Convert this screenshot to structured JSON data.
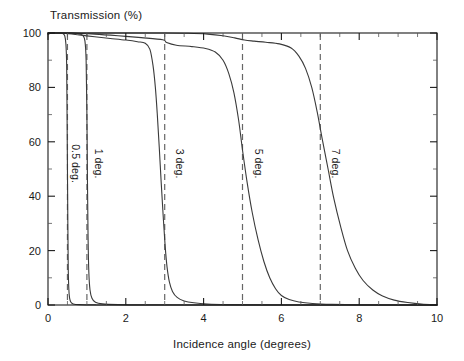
{
  "chart_data": {
    "type": "line",
    "title": "",
    "ylabel": "Transmission (%)",
    "xlabel": "Incidence angle (degrees)",
    "xlim": [
      0,
      10
    ],
    "ylim": [
      0,
      100
    ],
    "grid": false,
    "legend": "inline-rotated-labels",
    "xticks": [
      0,
      2,
      4,
      6,
      8,
      10
    ],
    "xticklabels": [
      "0",
      "2",
      "4",
      "6",
      "8",
      "10"
    ],
    "xminorticks": [
      0.5,
      1,
      1.5,
      2.5,
      3,
      3.5,
      4.5,
      5,
      5.5,
      6.5,
      7,
      7.5,
      8.5,
      9,
      9.5
    ],
    "yticks": [
      0,
      20,
      40,
      60,
      80,
      100
    ],
    "yticklabels": [
      "0",
      "20",
      "40",
      "60",
      "80",
      "100"
    ],
    "yminorticks": [
      10,
      30,
      50,
      70,
      90
    ],
    "reference_lines": [
      {
        "x": 0.5,
        "style": "dashed"
      },
      {
        "x": 1.0,
        "style": "dashed"
      },
      {
        "x": 3.0,
        "style": "dashed"
      },
      {
        "x": 5.0,
        "style": "dashed"
      },
      {
        "x": 7.0,
        "style": "dashed"
      }
    ],
    "annotations": [
      {
        "text": "0.5 deg.",
        "x": 0.62,
        "y": 52,
        "rotation": 90
      },
      {
        "text": "1 deg.",
        "x": 1.22,
        "y": 52,
        "rotation": 90
      },
      {
        "text": "3 deg.",
        "x": 3.3,
        "y": 52,
        "rotation": 90
      },
      {
        "text": "5 deg.",
        "x": 5.32,
        "y": 52,
        "rotation": 90
      },
      {
        "text": "7 deg.",
        "x": 7.3,
        "y": 52,
        "rotation": 90
      }
    ],
    "series": [
      {
        "name": "0.5 deg.",
        "cutoff": 0.5,
        "points": [
          [
            0.0,
            99.5
          ],
          [
            0.1,
            100.0
          ],
          [
            0.2,
            100.0
          ],
          [
            0.3,
            100.0
          ],
          [
            0.38,
            99.8
          ],
          [
            0.43,
            99.0
          ],
          [
            0.46,
            96.0
          ],
          [
            0.48,
            88.0
          ],
          [
            0.49,
            70.0
          ],
          [
            0.5,
            50.0
          ],
          [
            0.51,
            30.0
          ],
          [
            0.52,
            14.0
          ],
          [
            0.535,
            6.0
          ],
          [
            0.555,
            2.5
          ],
          [
            0.59,
            1.0
          ],
          [
            0.65,
            0.4
          ],
          [
            0.8,
            0.15
          ],
          [
            1.2,
            0.05
          ],
          [
            2.0,
            0.0
          ],
          [
            10.0,
            0.0
          ]
        ]
      },
      {
        "name": "1 deg.",
        "cutoff": 1.0,
        "points": [
          [
            0.0,
            100.0
          ],
          [
            0.3,
            100.0
          ],
          [
            0.55,
            100.0
          ],
          [
            0.7,
            99.9
          ],
          [
            0.82,
            99.6
          ],
          [
            0.9,
            99.0
          ],
          [
            0.95,
            97.0
          ],
          [
            0.98,
            90.0
          ],
          [
            1.0,
            70.0
          ],
          [
            1.015,
            45.0
          ],
          [
            1.03,
            25.0
          ],
          [
            1.05,
            12.0
          ],
          [
            1.08,
            5.5
          ],
          [
            1.13,
            2.5
          ],
          [
            1.22,
            1.0
          ],
          [
            1.4,
            0.4
          ],
          [
            1.8,
            0.15
          ],
          [
            2.5,
            0.05
          ],
          [
            4.0,
            0.0
          ],
          [
            10.0,
            0.0
          ]
        ]
      },
      {
        "name": "3 deg.",
        "cutoff": 3.0,
        "points": [
          [
            0.0,
            100.0
          ],
          [
            0.4,
            99.9
          ],
          [
            0.8,
            99.3
          ],
          [
            1.2,
            98.6
          ],
          [
            1.6,
            98.0
          ],
          [
            2.0,
            97.4
          ],
          [
            2.3,
            96.8
          ],
          [
            2.5,
            96.2
          ],
          [
            2.62,
            94.0
          ],
          [
            2.7,
            88.0
          ],
          [
            2.76,
            80.0
          ],
          [
            2.81,
            70.0
          ],
          [
            2.86,
            58.0
          ],
          [
            2.91,
            45.0
          ],
          [
            2.96,
            33.0
          ],
          [
            3.01,
            22.0
          ],
          [
            3.06,
            14.0
          ],
          [
            3.12,
            8.5
          ],
          [
            3.2,
            5.0
          ],
          [
            3.32,
            2.8
          ],
          [
            3.5,
            1.5
          ],
          [
            3.75,
            0.8
          ],
          [
            4.1,
            0.35
          ],
          [
            4.6,
            0.15
          ],
          [
            5.5,
            0.05
          ],
          [
            7.0,
            0.0
          ],
          [
            10.0,
            0.0
          ]
        ]
      },
      {
        "name": "5 deg.",
        "cutoff": 5.0,
        "points": [
          [
            0.0,
            100.0
          ],
          [
            0.6,
            100.0
          ],
          [
            1.2,
            99.6
          ],
          [
            1.8,
            99.0
          ],
          [
            2.4,
            98.3
          ],
          [
            2.95,
            97.5
          ],
          [
            3.05,
            96.5
          ],
          [
            3.3,
            95.5
          ],
          [
            3.7,
            95.0
          ],
          [
            4.05,
            94.3
          ],
          [
            4.3,
            93.0
          ],
          [
            4.5,
            90.0
          ],
          [
            4.65,
            85.0
          ],
          [
            4.78,
            78.0
          ],
          [
            4.9,
            68.0
          ],
          [
            5.0,
            57.0
          ],
          [
            5.12,
            45.0
          ],
          [
            5.25,
            34.0
          ],
          [
            5.4,
            24.0
          ],
          [
            5.55,
            16.0
          ],
          [
            5.7,
            10.0
          ],
          [
            5.85,
            6.0
          ],
          [
            6.0,
            3.5
          ],
          [
            6.2,
            2.0
          ],
          [
            6.45,
            1.1
          ],
          [
            6.8,
            0.55
          ],
          [
            7.3,
            0.25
          ],
          [
            8.0,
            0.1
          ],
          [
            9.0,
            0.0
          ],
          [
            10.0,
            0.0
          ]
        ]
      },
      {
        "name": "7 deg.",
        "cutoff": 7.0,
        "points": [
          [
            0.0,
            100.0
          ],
          [
            1.0,
            100.0
          ],
          [
            2.0,
            100.0
          ],
          [
            3.0,
            100.0
          ],
          [
            3.6,
            99.9
          ],
          [
            4.1,
            99.6
          ],
          [
            4.5,
            99.0
          ],
          [
            4.8,
            98.2
          ],
          [
            5.05,
            97.4
          ],
          [
            5.3,
            97.0
          ],
          [
            5.6,
            96.6
          ],
          [
            5.95,
            96.0
          ],
          [
            6.25,
            94.5
          ],
          [
            6.45,
            91.5
          ],
          [
            6.62,
            87.0
          ],
          [
            6.78,
            80.0
          ],
          [
            6.92,
            71.0
          ],
          [
            7.05,
            61.0
          ],
          [
            7.2,
            50.0
          ],
          [
            7.35,
            39.0
          ],
          [
            7.52,
            29.0
          ],
          [
            7.7,
            20.0
          ],
          [
            7.9,
            13.5
          ],
          [
            8.1,
            9.0
          ],
          [
            8.35,
            5.5
          ],
          [
            8.6,
            3.3
          ],
          [
            8.9,
            1.8
          ],
          [
            9.25,
            0.9
          ],
          [
            9.6,
            0.35
          ],
          [
            10.0,
            0.1
          ]
        ]
      }
    ]
  }
}
